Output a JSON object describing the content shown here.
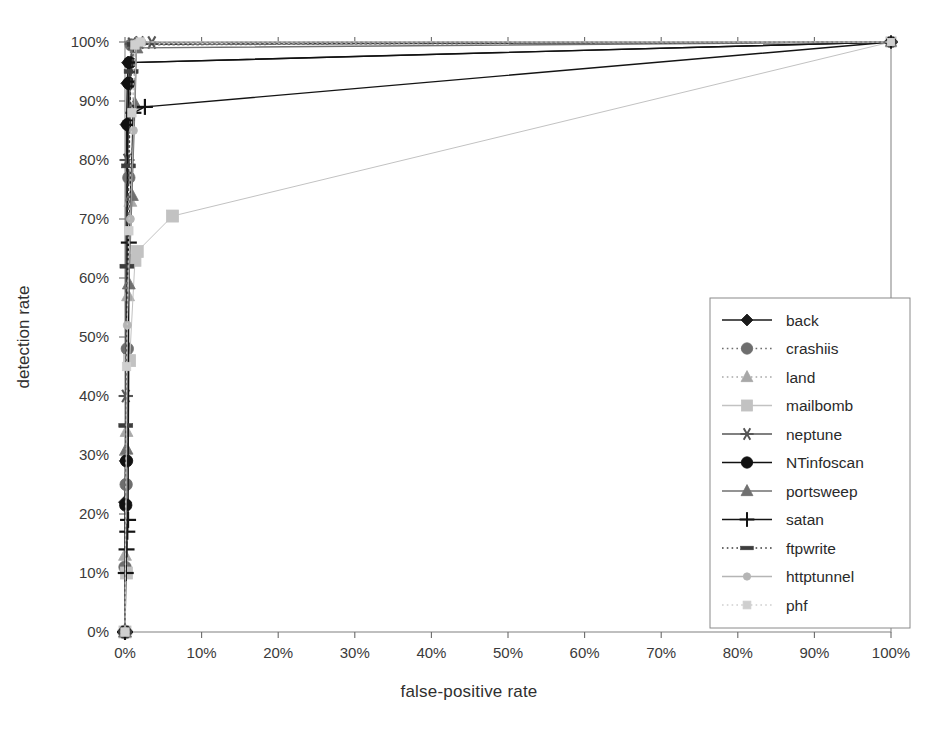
{
  "chart_data": {
    "type": "line",
    "title": "",
    "xlabel": "false-positive rate",
    "ylabel": "detection rate",
    "xlim": [
      0,
      100
    ],
    "ylim": [
      0,
      100
    ],
    "xticks": [
      "0%",
      "10%",
      "20%",
      "30%",
      "40%",
      "50%",
      "60%",
      "70%",
      "80%",
      "90%",
      "100%"
    ],
    "yticks": [
      "0%",
      "10%",
      "20%",
      "30%",
      "40%",
      "50%",
      "60%",
      "70%",
      "80%",
      "90%",
      "100%"
    ],
    "xtick_values": [
      0,
      10,
      20,
      30,
      40,
      50,
      60,
      70,
      80,
      90,
      100
    ],
    "ytick_values": [
      0,
      10,
      20,
      30,
      40,
      50,
      60,
      70,
      80,
      90,
      100
    ],
    "grid": false,
    "legend_position": "right-middle",
    "series": [
      {
        "name": "back",
        "marker": "diamond",
        "color": "#1a1a1a",
        "linestyle": "solid",
        "points": [
          [
            0,
            0
          ],
          [
            0,
            22
          ],
          [
            0.1,
            29
          ],
          [
            0.2,
            86
          ],
          [
            0.3,
            93
          ],
          [
            0.4,
            96.5
          ],
          [
            100,
            100
          ]
        ]
      },
      {
        "name": "crashiis",
        "marker": "circle",
        "color": "#6e6e6e",
        "linestyle": "dotted",
        "points": [
          [
            0,
            0
          ],
          [
            0,
            11
          ],
          [
            0.15,
            25
          ],
          [
            0.3,
            48
          ],
          [
            0.5,
            77
          ],
          [
            0.8,
            99.5
          ],
          [
            100,
            100
          ]
        ]
      },
      {
        "name": "land",
        "marker": "triangle",
        "color": "#a8a8a8",
        "linestyle": "dotted",
        "points": [
          [
            0,
            0
          ],
          [
            0,
            13
          ],
          [
            0.2,
            34
          ],
          [
            0.4,
            57
          ],
          [
            0.7,
            73
          ],
          [
            1.4,
            99.8
          ],
          [
            100,
            100
          ]
        ]
      },
      {
        "name": "mailbomb",
        "marker": "square",
        "color": "#c2c2c2",
        "linestyle": "solid",
        "points": [
          [
            0,
            0
          ],
          [
            0.2,
            10
          ],
          [
            0.6,
            46
          ],
          [
            1.3,
            63
          ],
          [
            1.6,
            64.5
          ],
          [
            6.2,
            70.5
          ],
          [
            100,
            100
          ]
        ]
      },
      {
        "name": "neptune",
        "marker": "asterisk",
        "color": "#565656",
        "linestyle": "solid",
        "points": [
          [
            0,
            0
          ],
          [
            0.1,
            40
          ],
          [
            0.3,
            80
          ],
          [
            0.9,
            99.7
          ],
          [
            1.9,
            99.9
          ],
          [
            3.5,
            99.9
          ],
          [
            100,
            100
          ]
        ]
      },
      {
        "name": "NTinfoscan",
        "marker": "circle-filled",
        "color": "#111111",
        "linestyle": "solid",
        "points": [
          [
            0,
            0
          ],
          [
            0.1,
            21.5
          ],
          [
            0.2,
            29
          ],
          [
            0.35,
            86
          ],
          [
            0.5,
            93
          ],
          [
            0.6,
            96.5
          ],
          [
            100,
            100
          ]
        ]
      },
      {
        "name": "portsweep",
        "marker": "triangle-filled",
        "color": "#707070",
        "linestyle": "solid",
        "points": [
          [
            0,
            0
          ],
          [
            0.2,
            31
          ],
          [
            0.5,
            59
          ],
          [
            0.9,
            74
          ],
          [
            1.3,
            89.5
          ],
          [
            1.5,
            99
          ],
          [
            100,
            100
          ]
        ]
      },
      {
        "name": "satan",
        "marker": "plus",
        "color": "#141414",
        "linestyle": "solid",
        "points": [
          [
            0,
            0
          ],
          [
            0.1,
            10
          ],
          [
            0.2,
            14
          ],
          [
            0.3,
            17
          ],
          [
            0.4,
            19
          ],
          [
            0.5,
            66
          ],
          [
            1.1,
            88
          ],
          [
            2.6,
            89
          ],
          [
            100,
            100
          ]
        ]
      },
      {
        "name": "ftpwrite",
        "marker": "dash",
        "color": "#3d3d3d",
        "linestyle": "dotted",
        "points": [
          [
            0,
            0
          ],
          [
            0.1,
            35
          ],
          [
            0.25,
            62
          ],
          [
            0.45,
            79
          ],
          [
            0.8,
            95
          ],
          [
            1.2,
            99.6
          ],
          [
            100,
            100
          ]
        ]
      },
      {
        "name": "httptunnel",
        "marker": "small-circle",
        "color": "#b5b5b5",
        "linestyle": "solid",
        "points": [
          [
            0,
            0
          ],
          [
            0.3,
            52
          ],
          [
            0.7,
            70
          ],
          [
            1.1,
            85
          ],
          [
            1.5,
            99.8
          ],
          [
            2.2,
            100
          ],
          [
            100,
            100
          ]
        ]
      },
      {
        "name": "phf",
        "marker": "small-square",
        "color": "#cfcfcf",
        "linestyle": "dotted",
        "points": [
          [
            0,
            0
          ],
          [
            0.2,
            45
          ],
          [
            0.5,
            68
          ],
          [
            0.9,
            88
          ],
          [
            1.3,
            99.5
          ],
          [
            2.0,
            100
          ],
          [
            100,
            100
          ]
        ]
      }
    ]
  },
  "legend": {
    "items": [
      {
        "label": "back"
      },
      {
        "label": "crashiis"
      },
      {
        "label": "land"
      },
      {
        "label": "mailbomb"
      },
      {
        "label": "neptune"
      },
      {
        "label": "NTinfoscan"
      },
      {
        "label": "portsweep"
      },
      {
        "label": "satan"
      },
      {
        "label": "ftpwrite"
      },
      {
        "label": "httptunnel"
      },
      {
        "label": "phf"
      }
    ]
  },
  "axes": {
    "frame_color": "#8a8a8a",
    "tick_color": "#6a6a6a",
    "background": "#ffffff"
  }
}
